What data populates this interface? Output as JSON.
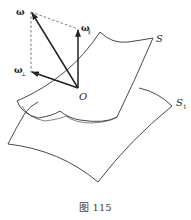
{
  "figure": {
    "caption": "图 115",
    "labels": {
      "omega": "ω",
      "omega_parallel": "ω",
      "omega_parallel_sub": "∥",
      "omega_perp": "ω",
      "omega_perp_sub": "⊥",
      "origin": "O",
      "surface_s": "S",
      "surface_s1": "S",
      "surface_s1_sub": "1"
    },
    "elements": {
      "vectors": [
        "ω",
        "ω∥",
        "ω⊥"
      ],
      "surfaces": [
        "S",
        "S1"
      ],
      "point": "O"
    },
    "colors": {
      "stroke": "#222222",
      "dashed": "#555555",
      "background": "#ffffff"
    }
  }
}
